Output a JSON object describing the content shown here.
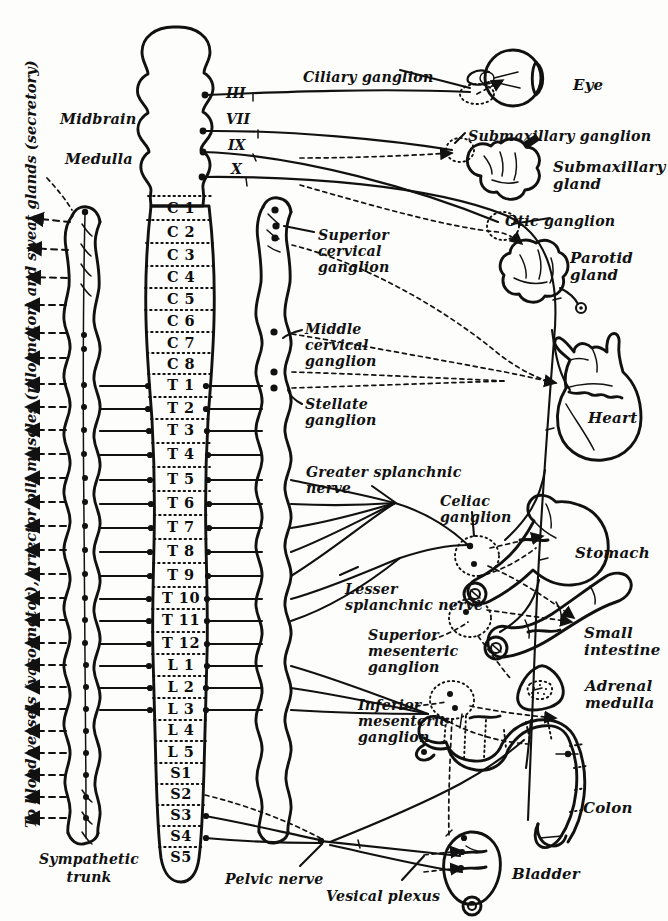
{
  "figure": {
    "background_color": "#fdfdfb",
    "ink_color": "#111111"
  },
  "cns": {
    "brain_labels": [
      {
        "text": "Midbrain",
        "x": 60,
        "y": 118
      },
      {
        "text": "Medulla",
        "x": 65,
        "y": 158
      }
    ],
    "cranial_nerves": [
      {
        "label": "III",
        "x": 228,
        "y": 96
      },
      {
        "label": "VII",
        "x": 228,
        "y": 122
      },
      {
        "label": "IX",
        "x": 230,
        "y": 148
      },
      {
        "label": "X",
        "x": 232,
        "y": 172
      }
    ],
    "cord_segments": [
      {
        "label": "C 1",
        "y": 208
      },
      {
        "label": "C 2",
        "y": 232
      },
      {
        "label": "C 3",
        "y": 255
      },
      {
        "label": "C 4",
        "y": 277
      },
      {
        "label": "C 5",
        "y": 299
      },
      {
        "label": "C 6",
        "y": 321
      },
      {
        "label": "C 7",
        "y": 343
      },
      {
        "label": "C 8",
        "y": 364
      },
      {
        "label": "T 1",
        "y": 385
      },
      {
        "label": "T 2",
        "y": 408
      },
      {
        "label": "T 3",
        "y": 430
      },
      {
        "label": "T 4",
        "y": 454
      },
      {
        "label": "T 5",
        "y": 479
      },
      {
        "label": "T 6",
        "y": 503
      },
      {
        "label": "T 7",
        "y": 527
      },
      {
        "label": "T 8",
        "y": 551
      },
      {
        "label": "T 9",
        "y": 575
      },
      {
        "label": "T 10",
        "y": 598
      },
      {
        "label": "T 11",
        "y": 620
      },
      {
        "label": "T 12",
        "y": 643
      },
      {
        "label": "L 1",
        "y": 665
      },
      {
        "label": "L 2",
        "y": 687
      },
      {
        "label": "L 3",
        "y": 709
      },
      {
        "label": "L 4",
        "y": 730
      },
      {
        "label": "L 5",
        "y": 752
      },
      {
        "label": "S1",
        "y": 773
      },
      {
        "label": "S2",
        "y": 794
      },
      {
        "label": "S3",
        "y": 815
      },
      {
        "label": "S4",
        "y": 836
      },
      {
        "label": "S5",
        "y": 857
      }
    ]
  },
  "left_annotation": {
    "vertical_text": "To blood vessels (vaso-motor), arrector pili muscles (pilo motor) and sweat glands (secretory)",
    "trunk_label_line1": "Sympathetic",
    "trunk_label_line2": "trunk"
  },
  "ganglia_labels": [
    {
      "name": "ciliary-ganglion",
      "text": "Ciliary ganglion",
      "x": 303,
      "y": 70,
      "align": "left"
    },
    {
      "name": "superior-cervical-ganglion",
      "text": "Superior\ncervical\nganglion",
      "x": 318,
      "y": 228,
      "align": "left"
    },
    {
      "name": "middle-cervical-ganglion",
      "text": "Middle\ncervical\nganglion",
      "x": 305,
      "y": 322,
      "align": "left"
    },
    {
      "name": "stellate-ganglion",
      "text": "Stellate\nganglion",
      "x": 305,
      "y": 397,
      "align": "left"
    },
    {
      "name": "greater-splanchnic-nerve",
      "text": "Greater splanchnic\nnerve",
      "x": 306,
      "y": 465,
      "align": "left"
    },
    {
      "name": "celiac-ganglion",
      "text": "Celiac\nganglion",
      "x": 440,
      "y": 494,
      "align": "left"
    },
    {
      "name": "lesser-splanchnic-nerve",
      "text": "Lesser\nsplanchnic nerve",
      "x": 345,
      "y": 582,
      "align": "left"
    },
    {
      "name": "superior-mesenteric-ganglion",
      "text": "Superior\nmesenteric\nganglion",
      "x": 368,
      "y": 628,
      "align": "left"
    },
    {
      "name": "inferior-mesenteric-ganglion",
      "text": "Inferior\nmesenteric\nganglion",
      "x": 358,
      "y": 698,
      "align": "left"
    },
    {
      "name": "submaxillary-ganglion",
      "text": "Submaxillary ganglion",
      "x": 468,
      "y": 129,
      "align": "left"
    },
    {
      "name": "otic-ganglion",
      "text": "Otic ganglion",
      "x": 505,
      "y": 214,
      "align": "left"
    },
    {
      "name": "pelvic-nerve",
      "text": "Pelvic nerve",
      "x": 225,
      "y": 872,
      "align": "left"
    },
    {
      "name": "vesical-plexus",
      "text": "Vesical plexus",
      "x": 326,
      "y": 889,
      "align": "left"
    }
  ],
  "organ_labels": [
    {
      "name": "eye",
      "text": "Eye",
      "x": 573,
      "y": 77
    },
    {
      "name": "submaxillary-gland",
      "text": "Submaxillary\ngland",
      "x": 553,
      "y": 159
    },
    {
      "name": "parotid-gland",
      "text": "Parotid\ngland",
      "x": 570,
      "y": 250
    },
    {
      "name": "heart",
      "text": "Heart",
      "x": 588,
      "y": 410
    },
    {
      "name": "stomach",
      "text": "Stomach",
      "x": 575,
      "y": 545
    },
    {
      "name": "small-intestine",
      "text": "Small\nintestine",
      "x": 584,
      "y": 625
    },
    {
      "name": "adrenal-medulla",
      "text": "Adrenal\nmedulla",
      "x": 585,
      "y": 678
    },
    {
      "name": "colon",
      "text": "Colon",
      "x": 583,
      "y": 800
    },
    {
      "name": "bladder",
      "text": "Bladder",
      "x": 512,
      "y": 866
    }
  ]
}
